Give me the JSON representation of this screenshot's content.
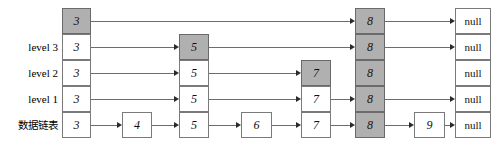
{
  "diagram": {
    "colors": {
      "shaded_fill": "#b0b0b0",
      "plain_fill": "#ffffff",
      "box_border": "#7a7a7a",
      "link": "#6d6d6d",
      "arrowhead": "#2b2b2b",
      "text": "#111111"
    },
    "row_labels": [
      {
        "text": "",
        "name": "row-label-top"
      },
      {
        "text": "level 3",
        "name": "row-label-level-3"
      },
      {
        "text": "level 2",
        "name": "row-label-level-2"
      },
      {
        "text": "level 1",
        "name": "row-label-level-1"
      },
      {
        "text": "数据链表",
        "name": "row-label-data-list"
      }
    ],
    "columns": [
      {
        "key": "c3",
        "x": 62,
        "w": 29
      },
      {
        "key": "c4",
        "x": 122,
        "w": 30
      },
      {
        "key": "c5",
        "x": 179,
        "w": 30
      },
      {
        "key": "c6",
        "x": 241,
        "w": 31
      },
      {
        "key": "c7",
        "x": 301,
        "w": 30
      },
      {
        "key": "c8",
        "x": 355,
        "w": 30
      },
      {
        "key": "c9",
        "x": 414,
        "w": 31
      },
      {
        "key": "cnull",
        "x": 455,
        "w": 36
      }
    ],
    "rows": [
      {
        "key": "top",
        "y": 8
      },
      {
        "key": "lvl3",
        "y": 34
      },
      {
        "key": "lvl2",
        "y": 60
      },
      {
        "key": "lvl1",
        "y": 86
      },
      {
        "key": "base",
        "y": 112
      }
    ],
    "row_height": 26,
    "nodes": [
      {
        "row": "top",
        "col": "c3",
        "value": "3",
        "shaded": true,
        "name": "node-3-top"
      },
      {
        "row": "top",
        "col": "c8",
        "value": "8",
        "shaded": true,
        "name": "node-8-top"
      },
      {
        "row": "top",
        "col": "cnull",
        "value": "null",
        "shaded": false,
        "name": "node-null-top"
      },
      {
        "row": "lvl3",
        "col": "c3",
        "value": "3",
        "shaded": false,
        "name": "node-3-level-3"
      },
      {
        "row": "lvl3",
        "col": "c5",
        "value": "5",
        "shaded": true,
        "name": "node-5-level-3"
      },
      {
        "row": "lvl3",
        "col": "c8",
        "value": "8",
        "shaded": true,
        "name": "node-8-level-3"
      },
      {
        "row": "lvl3",
        "col": "cnull",
        "value": "null",
        "shaded": false,
        "name": "node-null-level-3"
      },
      {
        "row": "lvl2",
        "col": "c3",
        "value": "3",
        "shaded": false,
        "name": "node-3-level-2"
      },
      {
        "row": "lvl2",
        "col": "c5",
        "value": "5",
        "shaded": false,
        "name": "node-5-level-2"
      },
      {
        "row": "lvl2",
        "col": "c7",
        "value": "7",
        "shaded": true,
        "name": "node-7-level-2"
      },
      {
        "row": "lvl2",
        "col": "c8",
        "value": "8",
        "shaded": true,
        "name": "node-8-level-2"
      },
      {
        "row": "lvl2",
        "col": "cnull",
        "value": "null",
        "shaded": false,
        "name": "node-null-level-2"
      },
      {
        "row": "lvl1",
        "col": "c3",
        "value": "3",
        "shaded": false,
        "name": "node-3-level-1"
      },
      {
        "row": "lvl1",
        "col": "c5",
        "value": "5",
        "shaded": false,
        "name": "node-5-level-1"
      },
      {
        "row": "lvl1",
        "col": "c7",
        "value": "7",
        "shaded": false,
        "name": "node-7-level-1"
      },
      {
        "row": "lvl1",
        "col": "c8",
        "value": "8",
        "shaded": true,
        "name": "node-8-level-1"
      },
      {
        "row": "lvl1",
        "col": "cnull",
        "value": "null",
        "shaded": false,
        "name": "node-null-level-1"
      },
      {
        "row": "base",
        "col": "c3",
        "value": "3",
        "shaded": false,
        "name": "node-3-base"
      },
      {
        "row": "base",
        "col": "c4",
        "value": "4",
        "shaded": false,
        "name": "node-4-base"
      },
      {
        "row": "base",
        "col": "c5",
        "value": "5",
        "shaded": false,
        "name": "node-5-base"
      },
      {
        "row": "base",
        "col": "c6",
        "value": "6",
        "shaded": false,
        "name": "node-6-base"
      },
      {
        "row": "base",
        "col": "c7",
        "value": "7",
        "shaded": false,
        "name": "node-7-base"
      },
      {
        "row": "base",
        "col": "c8",
        "value": "8",
        "shaded": true,
        "name": "node-8-base"
      },
      {
        "row": "base",
        "col": "c9",
        "value": "9",
        "shaded": false,
        "name": "node-9-base"
      },
      {
        "row": "base",
        "col": "cnull",
        "value": "null",
        "shaded": false,
        "name": "node-null-base"
      }
    ],
    "links": [
      {
        "row": "top",
        "from": "c3",
        "to": "c8",
        "name": "link-top-3-to-8"
      },
      {
        "row": "top",
        "from": "c8",
        "to": "cnull",
        "name": "link-top-8-to-null"
      },
      {
        "row": "lvl3",
        "from": "c3",
        "to": "c5",
        "name": "link-level-3-3-to-5"
      },
      {
        "row": "lvl3",
        "from": "c5",
        "to": "c8",
        "name": "link-level-3-5-to-8"
      },
      {
        "row": "lvl3",
        "from": "c8",
        "to": "cnull",
        "name": "link-level-3-8-to-null"
      },
      {
        "row": "lvl2",
        "from": "c3",
        "to": "c5",
        "name": "link-level-2-3-to-5"
      },
      {
        "row": "lvl2",
        "from": "c5",
        "to": "c7",
        "name": "link-level-2-5-to-7"
      },
      {
        "row": "lvl1",
        "from": "c3",
        "to": "c5",
        "name": "link-level-1-3-to-5"
      },
      {
        "row": "lvl1",
        "from": "c5",
        "to": "c7",
        "name": "link-level-1-5-to-7"
      },
      {
        "row": "lvl1",
        "from": "c7",
        "to": "c8",
        "name": "link-level-1-7-to-8"
      },
      {
        "row": "lvl1",
        "from": "c8",
        "to": "cnull",
        "name": "link-level-1-8-to-null"
      },
      {
        "row": "base",
        "from": "c3",
        "to": "c4",
        "name": "link-base-3-to-4"
      },
      {
        "row": "base",
        "from": "c4",
        "to": "c5",
        "name": "link-base-4-to-5"
      },
      {
        "row": "base",
        "from": "c5",
        "to": "c6",
        "name": "link-base-5-to-6"
      },
      {
        "row": "base",
        "from": "c6",
        "to": "c7",
        "name": "link-base-6-to-7"
      },
      {
        "row": "base",
        "from": "c7",
        "to": "c8",
        "name": "link-base-7-to-8"
      },
      {
        "row": "base",
        "from": "c8",
        "to": "c9",
        "name": "link-base-8-to-9"
      },
      {
        "row": "base",
        "from": "c9",
        "to": "cnull",
        "name": "link-base-9-to-null"
      }
    ]
  }
}
